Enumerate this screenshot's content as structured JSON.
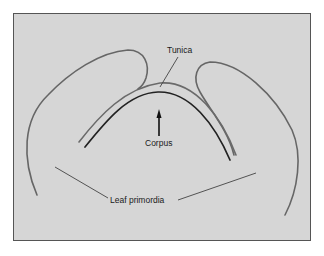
{
  "figure": {
    "labels": {
      "tunica": "Tunica",
      "corpus": "Corpus",
      "leaf_primordia": "Leaf primordia"
    },
    "colors": {
      "background": "#d6d6d6",
      "frame": "#555555",
      "leaf_outline": "#666666",
      "tunica_line": "#6a6a6a",
      "corpus_line": "#222222",
      "leader_line": "#444444",
      "arrow": "#111111",
      "text": "#1a1a1a"
    }
  }
}
